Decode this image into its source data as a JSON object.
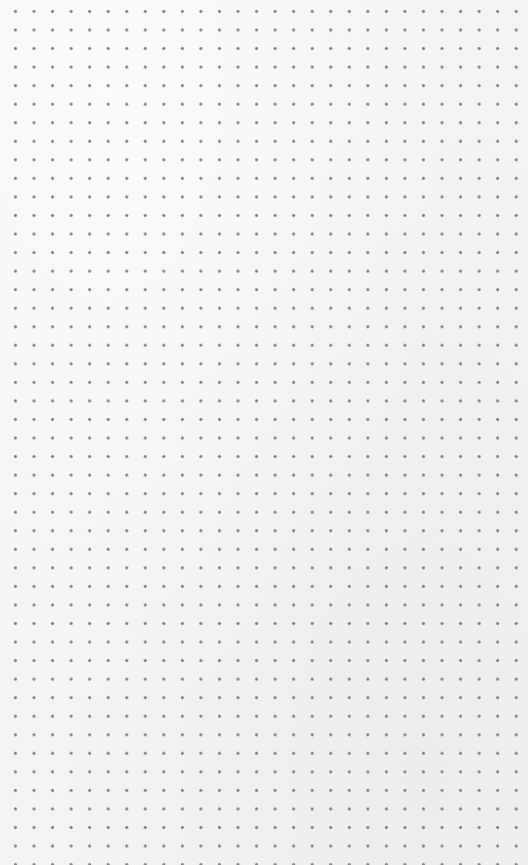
{
  "canvas": {
    "kind": "dot-grid",
    "background_color": "#f4f4f4",
    "dot_color": "#858585",
    "dot_spacing_px": 18.55,
    "first_dot_px": [
      34,
      30
    ],
    "columns": 27,
    "rows": 44,
    "label": "Empty dotted grid canvas"
  }
}
